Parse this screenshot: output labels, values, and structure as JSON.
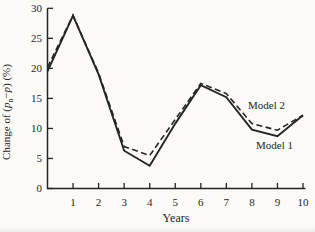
{
  "figure": {
    "background": "#fbfaf7",
    "ink": "#242424"
  },
  "chart_data": {
    "type": "line",
    "title": "",
    "xlabel": "Years",
    "ylabel": "Change of (pn−p) (%)",
    "ylabel_parts": [
      {
        "t": "Change of (",
        "style": "normal"
      },
      {
        "t": "p",
        "style": "italic"
      },
      {
        "t": "n",
        "style": "sub"
      },
      {
        "t": "−",
        "style": "normal"
      },
      {
        "t": "p",
        "style": "italic"
      },
      {
        "t": ") (%)",
        "style": "normal"
      }
    ],
    "x": [
      0,
      1,
      2,
      3,
      4,
      5,
      6,
      7,
      8,
      9,
      10
    ],
    "xlim": [
      0,
      10
    ],
    "ylim": [
      0,
      30
    ],
    "x_ticks": [
      1,
      2,
      3,
      4,
      5,
      6,
      7,
      8,
      9,
      10
    ],
    "y_ticks": [
      0,
      5,
      10,
      15,
      20,
      25,
      30
    ],
    "grid": false,
    "legend_position": "inline-annotations",
    "series": [
      {
        "name": "Model 1",
        "line_style": "solid",
        "values": [
          19.5,
          28.8,
          19.0,
          6.3,
          3.8,
          10.8,
          17.2,
          15.2,
          9.8,
          8.7,
          12.2
        ]
      },
      {
        "name": "Model 2",
        "line_style": "dashed",
        "values": [
          20.2,
          28.8,
          19.2,
          7.0,
          5.5,
          11.5,
          17.5,
          15.8,
          10.8,
          9.7,
          12.2
        ]
      }
    ],
    "annotations": [
      {
        "text": "Model 2",
        "x": 7.85,
        "y": 13.2
      },
      {
        "text": "Model 1",
        "x": 8.16,
        "y": 6.5
      }
    ]
  }
}
